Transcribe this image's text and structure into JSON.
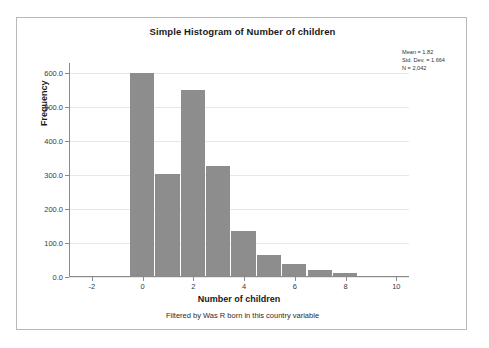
{
  "chart": {
    "title": "Simple Histogram of Number of children",
    "footnote": "Filtered by Was R born in this country variable",
    "xlabel": "Number of children",
    "ylabel": "Frequency",
    "bar_color": "#8d8d8d",
    "grid_color": "#e8e8e8",
    "axis_color": "#8a8a8a",
    "frame_color": "#b9b9b9",
    "background": "#ffffff"
  },
  "stats": {
    "mean_label": "Mean = 1.82",
    "std_dev_label": "Std. Dev. = 1.664",
    "n_label": "N = 2,042"
  },
  "chart_data": {
    "type": "bar",
    "title": "Simple Histogram of Number of children",
    "xlabel": "Number of children",
    "ylabel": "Frequency",
    "categories": [
      0,
      1,
      2,
      3,
      4,
      5,
      6,
      7,
      8
    ],
    "values": [
      597,
      301,
      547,
      325,
      133,
      61,
      35,
      18,
      8
    ],
    "xlim": [
      -2.9,
      10.5
    ],
    "ylim": [
      0,
      630
    ],
    "x_ticks": [
      -2,
      0,
      2,
      4,
      6,
      8,
      10
    ],
    "x_tick_labels": [
      "-2",
      "0",
      "2",
      "4",
      "6",
      "8",
      "10"
    ],
    "y_ticks": [
      0,
      100,
      200,
      300,
      400,
      500,
      600
    ],
    "y_tick_labels": [
      "0.0",
      "100.0",
      "200.0",
      "300.0",
      "400.0",
      "500.0",
      "600.0"
    ],
    "grid": true,
    "grid_axis": "y",
    "legend": false,
    "bar_width": 1,
    "annotations": [
      "Mean = 1.82",
      "Std. Dev. = 1.664",
      "N = 2,042"
    ]
  }
}
